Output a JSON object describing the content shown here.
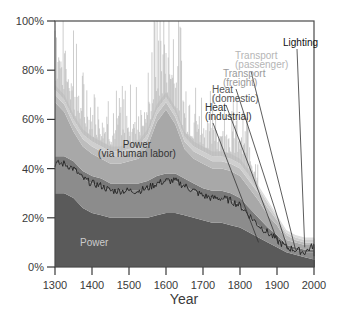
{
  "chart_data": {
    "type": "area",
    "stacked": true,
    "title": "",
    "xlabel": "Year",
    "ylabel": "",
    "xlim": [
      1300,
      2010
    ],
    "ylim": [
      0,
      100
    ],
    "x_ticks": [
      1300,
      1400,
      1500,
      1600,
      1700,
      1800,
      1900,
      2000
    ],
    "x_tick_labels": [
      "1300",
      "1400",
      "1500",
      "1600",
      "1700",
      "1800",
      "1900",
      "2000"
    ],
    "y_ticks": [
      0,
      20,
      40,
      60,
      80,
      100
    ],
    "y_tick_labels": [
      "0%",
      "20%",
      "40%",
      "60%",
      "80%",
      "100%"
    ],
    "grid": false,
    "x": [
      1300,
      1325,
      1350,
      1375,
      1400,
      1425,
      1450,
      1475,
      1500,
      1525,
      1550,
      1575,
      1600,
      1625,
      1650,
      1675,
      1700,
      1725,
      1750,
      1775,
      1800,
      1825,
      1850,
      1875,
      1900,
      1925,
      1950,
      1975,
      2000,
      2010
    ],
    "series": [
      {
        "name": "Power",
        "color": "#5a5a5a",
        "values": [
          30,
          30,
          28,
          24,
          22,
          21,
          20,
          20,
          20,
          20,
          20,
          21,
          22,
          22,
          21,
          20,
          19,
          18,
          18,
          17,
          16,
          14,
          12,
          10,
          8,
          6,
          5,
          4,
          3,
          3
        ]
      },
      {
        "name": "Power (via human labor)",
        "color": "#8c8c8c",
        "values": [
          12,
          12,
          12,
          12,
          12,
          12,
          11,
          11,
          11,
          11,
          12,
          13,
          13,
          13,
          12,
          11,
          10,
          10,
          10,
          10,
          9,
          7,
          5,
          4,
          3,
          2,
          2,
          2,
          3,
          2
        ]
      },
      {
        "name": "Heat (industrial)",
        "color": "#7a7a7a",
        "values": [
          3,
          3,
          3,
          3,
          3,
          3,
          3,
          3,
          3,
          3,
          3,
          3,
          3,
          3,
          3,
          3,
          3,
          3,
          3,
          3,
          3,
          3,
          3,
          2,
          2,
          1,
          1,
          1,
          1,
          1
        ]
      },
      {
        "name": "Heat (domestic)",
        "color": "#a8a8a8",
        "values": [
          22,
          18,
          12,
          10,
          9,
          8,
          8,
          8,
          9,
          10,
          14,
          22,
          26,
          20,
          12,
          10,
          10,
          9,
          9,
          9,
          9,
          8,
          7,
          5,
          4,
          2,
          2,
          2,
          2,
          2
        ]
      },
      {
        "name": "Transport (freight)",
        "color": "#bdbdbd",
        "values": [
          3,
          3,
          3,
          3,
          3,
          3,
          3,
          3,
          3,
          3,
          3,
          3,
          3,
          3,
          3,
          3,
          3,
          3,
          3,
          3,
          3,
          3,
          3,
          3,
          2,
          2,
          1,
          1,
          1,
          1
        ]
      },
      {
        "name": "Transport (passenger)",
        "color": "#cfcfcf",
        "values": [
          2,
          2,
          2,
          2,
          2,
          2,
          2,
          2,
          2,
          2,
          2,
          2,
          2,
          2,
          2,
          2,
          2,
          2,
          2,
          2,
          2,
          2,
          2,
          2,
          1,
          1,
          1,
          1,
          1,
          1
        ]
      },
      {
        "name": "Lighting",
        "color": "#dedede",
        "values": [
          2,
          2,
          2,
          2,
          2,
          2,
          2,
          2,
          2,
          2,
          2,
          2,
          2,
          2,
          2,
          2,
          2,
          2,
          2,
          2,
          2,
          2,
          1,
          1,
          1,
          1,
          1,
          1,
          1,
          1
        ]
      }
    ],
    "trend_line": {
      "name": "Power + human labor boundary",
      "color": "#222222",
      "values": [
        42,
        42,
        40,
        36,
        34,
        33,
        31,
        31,
        31,
        31,
        32,
        34,
        35,
        35,
        33,
        31,
        29,
        28,
        28,
        27,
        25,
        21,
        17,
        14,
        11,
        8,
        7,
        6,
        9,
        5
      ]
    },
    "annotations": [
      {
        "text": "Power",
        "color": "#cccccc",
        "series": "Power"
      },
      {
        "text": "Power",
        "color": "#333333",
        "series": "Power (via human labor)"
      },
      {
        "text": "(via human labor)",
        "color": "#333333",
        "series": "Power (via human labor)"
      },
      {
        "text": "Heat",
        "color": "#333333",
        "series": "Heat (industrial)"
      },
      {
        "text": "(industrial)",
        "color": "#333333",
        "series": "Heat (industrial)"
      },
      {
        "text": "Heat",
        "color": "#555555",
        "series": "Heat (domestic)"
      },
      {
        "text": "(domestic)",
        "color": "#555555",
        "series": "Heat (domestic)"
      },
      {
        "text": "Transport",
        "color": "#9a9a9a",
        "series": "Transport (freight)"
      },
      {
        "text": "(freight)",
        "color": "#9a9a9a",
        "series": "Transport (freight)"
      },
      {
        "text": "Transport",
        "color": "#b5b5b5",
        "series": "Transport (passenger)"
      },
      {
        "text": "(passenger)",
        "color": "#b5b5b5",
        "series": "Transport (passenger)"
      },
      {
        "text": "Lighting",
        "color": "#111111",
        "series": "Lighting"
      }
    ],
    "leader_lines": [
      {
        "label": "Heat (industrial)",
        "year": 1850,
        "value": 10
      },
      {
        "label": "Heat (domestic)",
        "year": 1905,
        "value": 9
      },
      {
        "label": "Transport (freight)",
        "year": 1930,
        "value": 7
      },
      {
        "label": "Transport (passenger)",
        "year": 1950,
        "value": 7
      },
      {
        "label": "Lighting",
        "year": 1975,
        "value": 8
      }
    ]
  }
}
